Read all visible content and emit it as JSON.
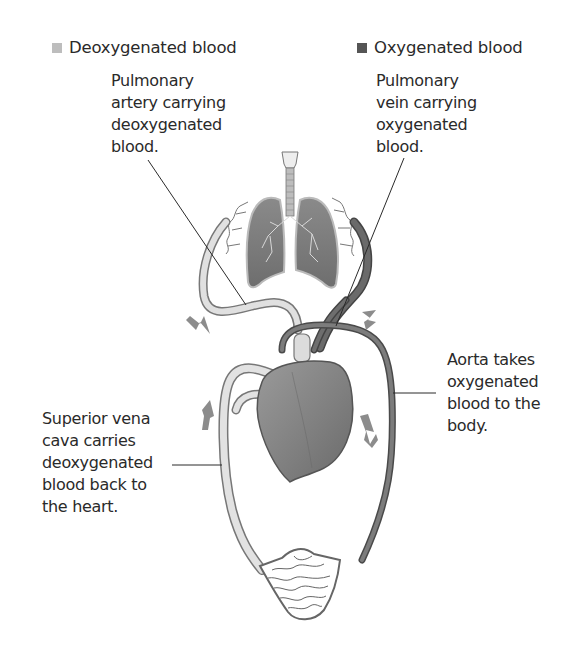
{
  "legend": {
    "deoxygenated": {
      "label": "Deoxygenated blood",
      "color": "#bdbdbd"
    },
    "oxygenated": {
      "label": "Oxygenated blood",
      "color": "#555555"
    }
  },
  "labels": {
    "pulmonary_artery": "Pulmonary\nartery carrying\ndeoxygenated\nblood.",
    "pulmonary_vein": "Pulmonary\nvein carrying\noxygenated\nblood.",
    "aorta": "Aorta takes\noxygenated\nblood to the\nbody.",
    "vena_cava": "Superior vena\ncava carries\ndeoxygenated\nblood back to\nthe heart."
  },
  "colors": {
    "text": "#2a2a2a",
    "vessel_light": "#d4d4d4",
    "vessel_dark": "#6a6a6a",
    "heart": "#8a8a8a",
    "lung": "#7a7a7a",
    "arrow": "#8c8c8c",
    "outline": "#5a5a5a"
  }
}
